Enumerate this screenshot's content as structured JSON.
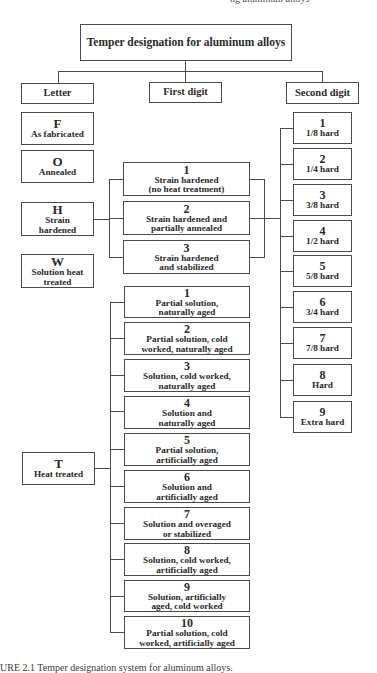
{
  "header_cut_text": "ng aluminum alloys",
  "title": "Temper designation for aluminum alloys",
  "columns": {
    "letter": "Letter",
    "first_digit": "First digit",
    "second_digit": "Second digit"
  },
  "letters": [
    {
      "code": "F",
      "label": "As fabricated"
    },
    {
      "code": "O",
      "label": "Annealed"
    },
    {
      "code": "H",
      "label": "Strain hardened"
    },
    {
      "code": "W",
      "label": "Solution heat treated"
    },
    {
      "code": "T",
      "label": "Heat treated"
    }
  ],
  "h_first_digit": [
    {
      "num": "1",
      "line1": "Strain hardened",
      "line2": "(no heat treatment)"
    },
    {
      "num": "2",
      "line1": "Strain hardened and",
      "line2": "partially annealed"
    },
    {
      "num": "3",
      "line1": "Strain hardened",
      "line2": "and stabilized"
    }
  ],
  "t_first_digit": [
    {
      "num": "1",
      "line1": "Partial solution,",
      "line2": "naturally aged"
    },
    {
      "num": "2",
      "line1": "Partial solution, cold",
      "line2": "worked, naturally aged"
    },
    {
      "num": "3",
      "line1": "Solution, cold worked,",
      "line2": "naturally aged"
    },
    {
      "num": "4",
      "line1": "Solution and",
      "line2": "naturally aged"
    },
    {
      "num": "5",
      "line1": "Partial solution,",
      "line2": "artificially aged"
    },
    {
      "num": "6",
      "line1": "Solution and",
      "line2": "artificially aged"
    },
    {
      "num": "7",
      "line1": "Solution and overaged",
      "line2": "or stabilized"
    },
    {
      "num": "8",
      "line1": "Solution, cold worked,",
      "line2": "artificially aged"
    },
    {
      "num": "9",
      "line1": "Solution, artificially",
      "line2": "aged, cold worked"
    },
    {
      "num": "10",
      "line1": "Partial solution, cold",
      "line2": "worked, artificially aged"
    }
  ],
  "second_digit": [
    {
      "num": "1",
      "label": "1/8 hard"
    },
    {
      "num": "2",
      "label": "1/4 hard"
    },
    {
      "num": "3",
      "label": "3/8 hard"
    },
    {
      "num": "4",
      "label": "1/2 hard"
    },
    {
      "num": "5",
      "label": "5/8 hard"
    },
    {
      "num": "6",
      "label": "3/4 hard"
    },
    {
      "num": "7",
      "label": "7/8 hard"
    },
    {
      "num": "8",
      "label": "Hard"
    },
    {
      "num": "9",
      "label": "Extra hard"
    }
  ],
  "caption": "URE 2.1   Temper designation system for aluminum alloys."
}
